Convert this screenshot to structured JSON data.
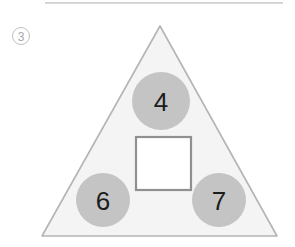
{
  "figure": {
    "item_number": "3",
    "title": "",
    "shape": "triangle",
    "colors": {
      "triangle_fill": "#f4f4f4",
      "triangle_stroke": "#b4b4b4",
      "circle_fill": "#c4c4c4",
      "square_fill": "#ffffff",
      "square_stroke": "#909090",
      "label_text": "#1c1c1c",
      "rule": "#cccccc",
      "item_number_color": "#a8a8a8"
    },
    "triangle": {
      "apex": [
        160,
        26
      ],
      "bottom_left": [
        42,
        236
      ],
      "bottom_right": [
        277,
        236
      ]
    },
    "missing_slot": {
      "name": "empty-square",
      "value": "",
      "x": 136,
      "y": 137,
      "width": 55,
      "height": 53
    },
    "nodes": [
      {
        "name": "top-circle",
        "value": "4",
        "cx": 161,
        "cy": 101,
        "r": 29
      },
      {
        "name": "bottom-left-circle",
        "value": "6",
        "cx": 103,
        "cy": 200,
        "r": 27
      },
      {
        "name": "bottom-right-circle",
        "value": "7",
        "cx": 219,
        "cy": 200,
        "r": 27
      }
    ]
  }
}
